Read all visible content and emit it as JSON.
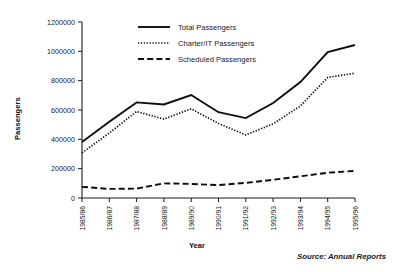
{
  "chart_data": {
    "type": "line",
    "title": "",
    "xlabel": "Year",
    "ylabel": "Passengers",
    "categories": [
      "1985/86",
      "1986/87",
      "1987/88",
      "1988/89",
      "1989/90",
      "1990/91",
      "1991/92",
      "1992/93",
      "1993/94",
      "1994/95",
      "1995/96"
    ],
    "ylim": [
      0,
      1200000
    ],
    "yticks": [
      0,
      200000,
      400000,
      600000,
      800000,
      1000000,
      1200000
    ],
    "ytick_labels": [
      "0",
      "200000",
      "400000",
      "600000",
      "800000",
      "1000000",
      "1200000"
    ],
    "grid": false,
    "legend_position": "top-center",
    "series": [
      {
        "name": "Total Passengers",
        "style": "solid",
        "values": [
          382000,
          520000,
          652000,
          638000,
          702000,
          585000,
          545000,
          648000,
          790000,
          995000,
          1043000
        ]
      },
      {
        "name": "Charter/IT Passengers",
        "style": "dotted",
        "values": [
          308000,
          443000,
          590000,
          538000,
          608000,
          508000,
          430000,
          505000,
          628000,
          822000,
          851000
        ]
      },
      {
        "name": "Scheduled Passengers",
        "style": "dashed",
        "values": [
          76000,
          62000,
          64000,
          100000,
          96000,
          88000,
          103000,
          124000,
          148000,
          172000,
          185000
        ]
      }
    ],
    "annotations": [
      {
        "name": "source",
        "text": "Source: Annual Reports"
      }
    ]
  }
}
